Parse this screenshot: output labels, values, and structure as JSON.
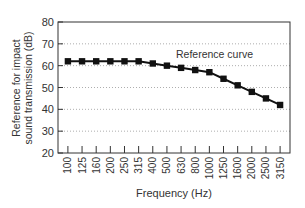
{
  "chart_data": {
    "type": "line",
    "title": "",
    "xlabel": "Frequency (Hz)",
    "ylabel_line1": "Reference for impact",
    "ylabel_line2": "sound transmission (dB)",
    "ylabel": "Reference for impact sound transmission (dB)",
    "ylim": [
      20,
      80
    ],
    "yticks": [
      20,
      30,
      40,
      50,
      60,
      70,
      80
    ],
    "grid": "horizontal dotted",
    "categories": [
      "100",
      "125",
      "160",
      "200",
      "250",
      "315",
      "400",
      "500",
      "630",
      "800",
      "1000",
      "1250",
      "1600",
      "2000",
      "2500",
      "3150"
    ],
    "series": [
      {
        "name": "Reference curve",
        "values": [
          62,
          62,
          62,
          62,
          62,
          62,
          61,
          60,
          59,
          58,
          57,
          54,
          51,
          48,
          45,
          42
        ],
        "marker": "square",
        "color": "#111111"
      }
    ],
    "annotations": [
      {
        "text": "Reference curve",
        "near": "1000 Hz",
        "y": 66
      }
    ],
    "legend": "none (inline annotation)"
  }
}
